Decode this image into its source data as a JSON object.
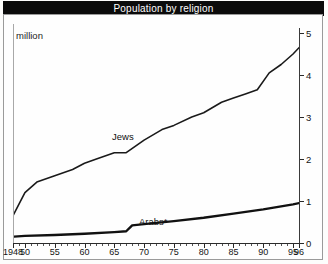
{
  "title": "Population by religion",
  "unit_label": "million",
  "chart_data": {
    "type": "line",
    "title": "Population by religion",
    "xlabel": "",
    "ylabel": "million",
    "ylim": [
      0,
      5
    ],
    "xlim": [
      1948,
      1996
    ],
    "grid": false,
    "legend_position": "inline-labels",
    "y_ticks": [
      "0",
      "1",
      "2",
      "3",
      "4",
      "5"
    ],
    "y_tick_values": [
      0,
      1,
      2,
      3,
      4,
      5
    ],
    "x_ticks": [
      "1948",
      "50",
      "55",
      "60",
      "65",
      "70",
      "75",
      "80",
      "85",
      "90",
      "95",
      "96"
    ],
    "x_tick_values": [
      1948,
      1950,
      1955,
      1960,
      1965,
      1970,
      1975,
      1980,
      1985,
      1990,
      1995,
      1996
    ],
    "axis_note": "y-axis drawn on right side",
    "series": [
      {
        "name": "Jews",
        "label": "Jews",
        "color": "#1a1a1a",
        "x": [
          1948,
          1950,
          1952,
          1955,
          1958,
          1960,
          1962,
          1965,
          1967,
          1970,
          1973,
          1975,
          1978,
          1980,
          1983,
          1985,
          1987,
          1989,
          1991,
          1993,
          1995,
          1996
        ],
        "values": [
          0.65,
          1.2,
          1.45,
          1.6,
          1.75,
          1.9,
          2.0,
          2.15,
          2.15,
          2.45,
          2.7,
          2.8,
          3.0,
          3.1,
          3.35,
          3.45,
          3.55,
          3.65,
          4.05,
          4.25,
          4.5,
          4.65
        ]
      },
      {
        "name": "Arabs",
        "label": "Arabs*",
        "color": "#111111",
        "x": [
          1948,
          1950,
          1955,
          1960,
          1965,
          1967,
          1968,
          1970,
          1975,
          1980,
          1985,
          1990,
          1995,
          1996
        ],
        "values": [
          0.15,
          0.17,
          0.19,
          0.22,
          0.26,
          0.28,
          0.42,
          0.45,
          0.52,
          0.6,
          0.7,
          0.8,
          0.92,
          0.95
        ]
      }
    ],
    "annotations": [
      {
        "text": "Jews",
        "x": 1963,
        "y": 2.45
      },
      {
        "text": "Arabs*",
        "x": 1972,
        "y": 0.78
      }
    ]
  }
}
